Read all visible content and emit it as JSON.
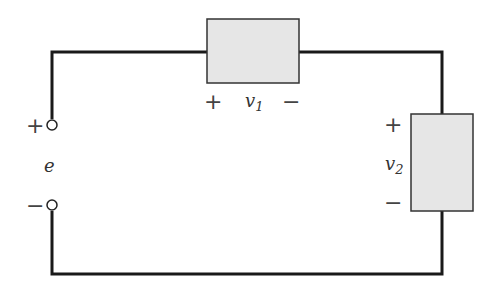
{
  "diagram": {
    "type": "series circuit",
    "source": {
      "label": "e",
      "plus": "+",
      "minus": "−"
    },
    "element1": {
      "label": "v",
      "subscript": "1",
      "plus": "+",
      "minus": "−"
    },
    "element2": {
      "label": "v",
      "subscript": "2",
      "plus": "+",
      "minus": "−"
    },
    "colors": {
      "wire": "#1a1a1a",
      "box_fill": "#e6e6e6",
      "box_stroke": "#333333",
      "text": "#333333"
    }
  }
}
